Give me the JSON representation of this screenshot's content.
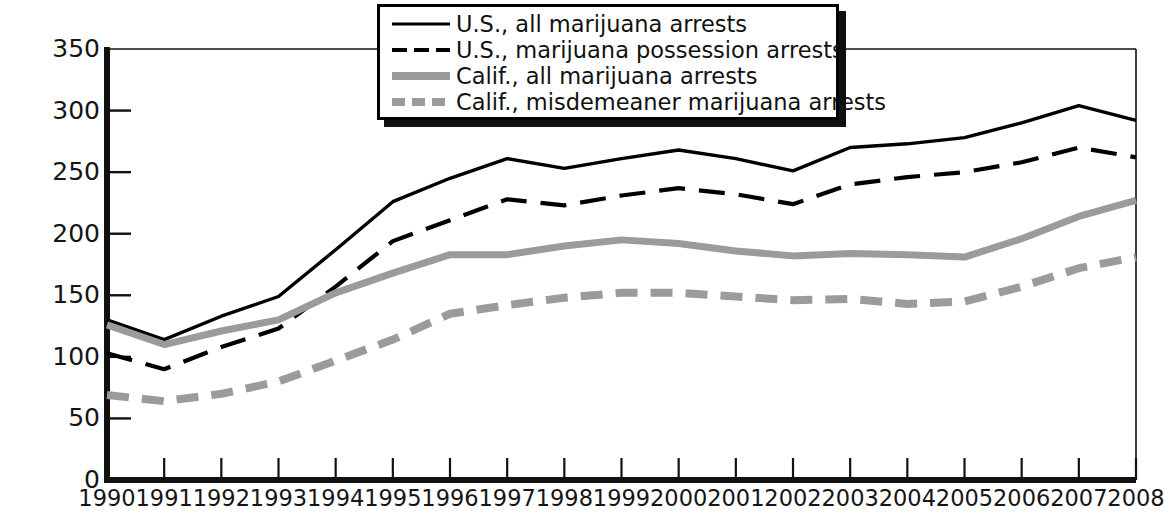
{
  "chart_data": {
    "type": "line",
    "title": "",
    "xlabel": "",
    "ylabel": "Arrests per 100,000 population",
    "x": [
      1990,
      1991,
      1992,
      1993,
      1994,
      1995,
      1996,
      1997,
      1998,
      1999,
      2000,
      2001,
      2002,
      2003,
      2004,
      2005,
      2006,
      2007,
      2008
    ],
    "categories": [
      "1990",
      "1991",
      "1992",
      "1993",
      "1994",
      "1995",
      "1996",
      "1997",
      "1998",
      "1999",
      "2000",
      "2001",
      "2002",
      "2003",
      "2004",
      "2005",
      "2006",
      "2007",
      "2008"
    ],
    "xlim": [
      1990,
      2008
    ],
    "ylim": [
      0,
      350
    ],
    "yticks": [
      0,
      50,
      100,
      150,
      200,
      250,
      300,
      350
    ],
    "ytick_labels": [
      "0",
      "50",
      "100",
      "150",
      "200",
      "250",
      "300",
      "350"
    ],
    "grid": false,
    "legend_position": "top-center",
    "series": [
      {
        "name": "U.S., all marijuana arrests",
        "style": "solid",
        "color": "#000000",
        "values": [
          130,
          114,
          133,
          149,
          187,
          226,
          245,
          261,
          253,
          261,
          268,
          261,
          251,
          270,
          273,
          278,
          290,
          304,
          292
        ]
      },
      {
        "name": "U.S., marijuana possession arrests",
        "style": "dashed",
        "color": "#000000",
        "values": [
          103,
          90,
          108,
          123,
          157,
          194,
          211,
          228,
          223,
          231,
          237,
          232,
          224,
          240,
          246,
          250,
          258,
          270,
          262
        ]
      },
      {
        "name": "Calif., all marijuana arrests",
        "style": "solid",
        "color": "#9b9b9b",
        "values": [
          126,
          110,
          121,
          130,
          152,
          168,
          183,
          183,
          190,
          195,
          192,
          186,
          182,
          184,
          183,
          181,
          196,
          214,
          227
        ]
      },
      {
        "name": "Calif., misdemeaner marijuana arrests",
        "style": "dashed",
        "color": "#9b9b9b",
        "values": [
          69,
          64,
          70,
          80,
          97,
          114,
          135,
          142,
          148,
          152,
          152,
          149,
          146,
          147,
          143,
          145,
          157,
          172,
          181
        ]
      }
    ]
  },
  "legend": {
    "items": [
      {
        "label": "U.S., all marijuana arrests",
        "swatch": "solid-black-line-swatch"
      },
      {
        "label": "U.S., marijuana possession arrests",
        "swatch": "dashed-black-line-swatch"
      },
      {
        "label": "Calif., all marijuana arrests",
        "swatch": "solid-gray-line-swatch"
      },
      {
        "label": "Calif., misdemeaner marijuana arrests",
        "swatch": "dashed-gray-line-swatch"
      }
    ]
  },
  "axes": {
    "y_title": "Arrests per 100,000 population"
  },
  "colors": {
    "us_line": "#000000",
    "calif_line": "#9b9b9b",
    "axis": "#111111",
    "background": "#ffffff"
  }
}
